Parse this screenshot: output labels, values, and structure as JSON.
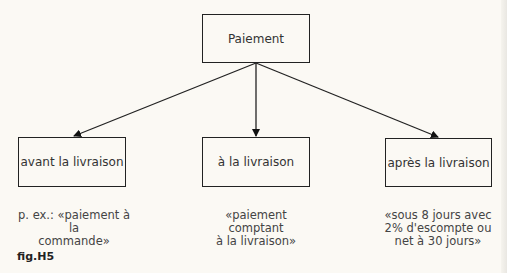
{
  "diagram": {
    "root": {
      "label": "Paiement"
    },
    "children": [
      {
        "label": "avant la livraison",
        "note": "p. ex.: «paiement à la\ncommande»"
      },
      {
        "label": "à la livraison",
        "note": "«paiement comptant\nà la livraison»"
      },
      {
        "label": "après la livraison",
        "note": "«sous 8 jours avec\n2% d'escompte ou\nnet à 30 jours»"
      }
    ],
    "figure_label": "fig.H5"
  },
  "colors": {
    "background": "#fbf9f4",
    "line": "#222222",
    "text": "#333333"
  }
}
